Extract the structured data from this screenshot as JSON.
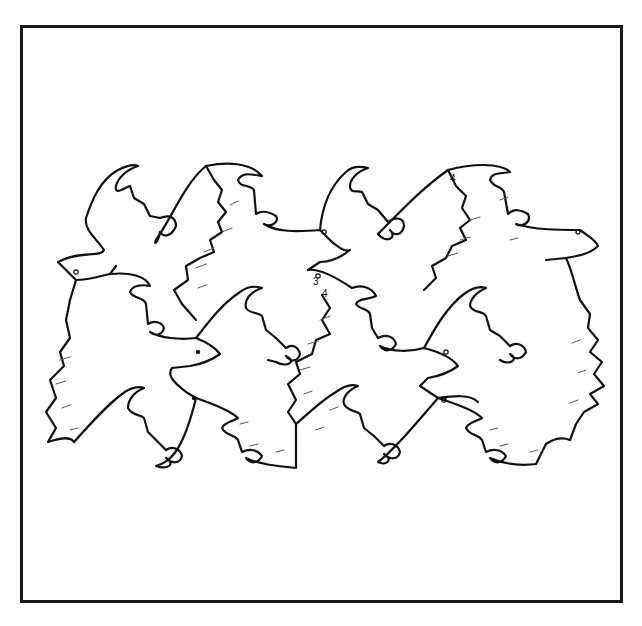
{
  "figure": {
    "vertex_labels": [
      {
        "text": "3",
        "x": 313,
        "y": 285
      },
      {
        "text": "4",
        "x": 322,
        "y": 295
      },
      {
        "text": "4",
        "x": 450,
        "y": 182
      }
    ],
    "colors": {
      "line": "#111111",
      "background": "#ffffff",
      "frame": "#1a1a1a"
    }
  }
}
